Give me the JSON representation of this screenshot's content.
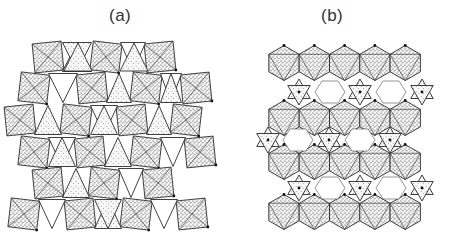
{
  "figure": {
    "panels": [
      {
        "id": "a",
        "label": "(a)",
        "description": "Layered framework of octahedra (stippled squares) and tetrahedra (triangles), edge-sharing chains"
      },
      {
        "id": "b",
        "label": "(b)",
        "description": "Hexagonal sheets of octahedra with tetrahedral pairs bridging, leaving hexagonal open channels"
      }
    ],
    "colors": {
      "background": "#ffffff",
      "line": "#2a2a2a",
      "stipple_fill": "#bdbdbd",
      "light_fill": "#e4e4e4",
      "label": "#333333"
    }
  }
}
